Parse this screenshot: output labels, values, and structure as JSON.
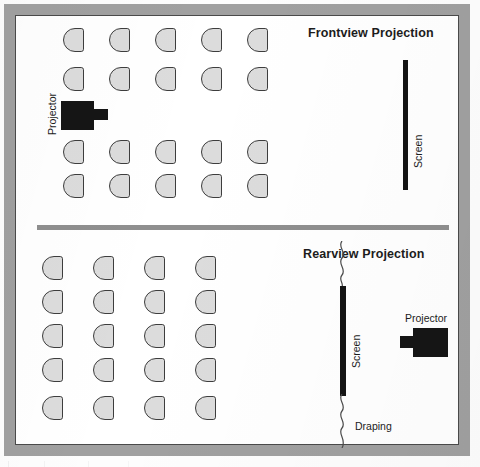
{
  "diagram": {
    "type": "floor-plan",
    "title_visible": false,
    "frame": {
      "border_color": "#a0a0a0",
      "interior_color": "#ffffff",
      "inner_line_color": "#4a4a4a"
    },
    "divider": {
      "color": "#8f8f8f",
      "orientation": "horizontal"
    },
    "colors": {
      "chair_fill": "#dcdcdc",
      "chair_stroke": "#3d3d3d",
      "equipment_black": "#151515",
      "text": "#1c1c1c"
    },
    "sections": [
      {
        "id": "frontview",
        "title": "Frontview Projection",
        "seating": {
          "rows": 4,
          "columns": 5,
          "total_chairs": 20,
          "chair_shape": "half-round-d",
          "chair_facing": "right"
        },
        "equipment": [
          {
            "name": "Projector",
            "label": "Projector",
            "label_orientation": "vertical",
            "position": "center-left, between row 2 and row 3",
            "lens_direction": "right"
          },
          {
            "name": "Screen",
            "label": "Screen",
            "label_orientation": "vertical",
            "position": "right wall",
            "orientation": "vertical-bar"
          }
        ]
      },
      {
        "id": "rearview",
        "title": "Rearview Projection",
        "seating": {
          "rows": 5,
          "columns": 4,
          "total_chairs": 20,
          "chair_shape": "half-round-d",
          "chair_facing": "right"
        },
        "equipment": [
          {
            "name": "Screen",
            "label": "Screen",
            "label_orientation": "vertical",
            "position": "center-right",
            "orientation": "vertical-bar"
          },
          {
            "name": "Draping",
            "label": "Draping",
            "label_orientation": "horizontal",
            "position": "above and below screen",
            "style": "wavy-line"
          },
          {
            "name": "Projector",
            "label": "Projector",
            "label_orientation": "horizontal",
            "position": "far right, behind screen",
            "lens_direction": "left"
          }
        ]
      }
    ]
  },
  "chair_layout": {
    "frontview": {
      "x_positions": [
        63,
        109,
        155,
        201,
        247
      ],
      "y_positions": [
        28,
        67,
        140,
        174
      ]
    },
    "rearview": {
      "x_positions": [
        42,
        93,
        144,
        195
      ],
      "y_positions": [
        256,
        290,
        324,
        358,
        396
      ]
    }
  }
}
